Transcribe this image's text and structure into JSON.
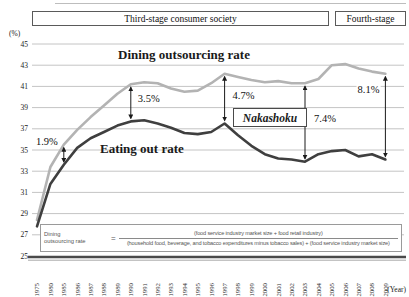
{
  "banner": {
    "third_stage": "Third-stage consumer society",
    "fourth_stage": "Fourth-stage"
  },
  "axes": {
    "y_unit": "(%)",
    "x_unit": "(Year)",
    "y_ticks": [
      45,
      43,
      41,
      39,
      37,
      35,
      33,
      31,
      29,
      27,
      25
    ]
  },
  "chart_data": {
    "type": "line",
    "title": "",
    "xlabel": "(Year)",
    "ylabel": "(%)",
    "ylim": [
      25,
      45
    ],
    "grid": true,
    "legend_position": "inline-labels",
    "categories": [
      "1975",
      "1980",
      "1985",
      "1986",
      "1987",
      "1988",
      "1989",
      "1990",
      "1991",
      "1992",
      "1993",
      "1994",
      "1995",
      "1996",
      "1997",
      "1998",
      "1999",
      "2000",
      "2001",
      "2002",
      "2003",
      "2004",
      "2005",
      "2006",
      "2007",
      "2008",
      "2009"
    ],
    "series": [
      {
        "name": "Dining outsourcing rate",
        "color": "#b3b3b3",
        "values": [
          28.4,
          33.4,
          35.5,
          36.9,
          38.1,
          39.2,
          40.3,
          41.2,
          41.4,
          41.3,
          40.8,
          40.5,
          40.6,
          41.3,
          42.2,
          41.9,
          41.6,
          41.4,
          41.5,
          41.3,
          41.3,
          41.7,
          43.0,
          43.1,
          42.7,
          42.4,
          42.2
        ]
      },
      {
        "name": "Eating out rate",
        "color": "#3f3f3f",
        "values": [
          27.8,
          31.8,
          33.6,
          35.2,
          36.1,
          36.7,
          37.3,
          37.7,
          37.8,
          37.5,
          37.1,
          36.6,
          36.5,
          36.7,
          37.5,
          36.4,
          35.4,
          34.6,
          34.2,
          34.1,
          33.9,
          34.6,
          34.9,
          35.0,
          34.4,
          34.6,
          34.1
        ]
      }
    ],
    "annotations": [
      {
        "label": "1.9%",
        "year": "1985"
      },
      {
        "label": "3.5%",
        "year": "1990"
      },
      {
        "label": "4.7%",
        "year": "1997"
      },
      {
        "label": "7.4%",
        "year": "2003"
      },
      {
        "label": "8.1%",
        "year": "2009"
      }
    ],
    "callout": "Nakashoku"
  },
  "formula": {
    "lhs_line1": "Dining",
    "lhs_line2": "outsourcing rate",
    "equals": "=",
    "numerator": "(food service industry market size + food retail industry)",
    "denominator": "(household food, beverage, and tobacco expenditures minus tobacco sales) + (food service industry market size)"
  }
}
